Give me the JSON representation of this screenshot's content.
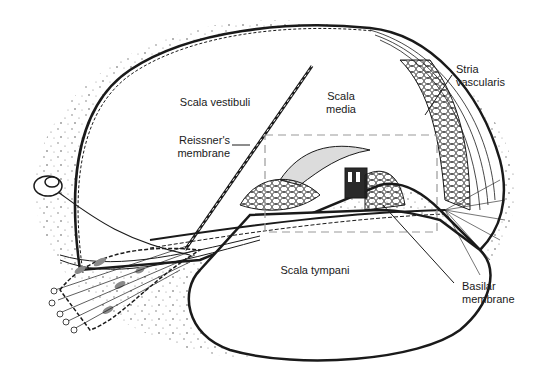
{
  "diagram": {
    "colors": {
      "ink": "#1a1a1a",
      "shade": "#8a8a8a",
      "stipple": "#555555",
      "inset_box": "#9a9a9a",
      "background": "#ffffff"
    },
    "labels": {
      "scala_vestibuli": "Scala vestibuli",
      "scala_media_1": "Scala",
      "scala_media_2": "media",
      "reissners_1": "Reissner's",
      "reissners_2": "membrane",
      "stria_1": "Stria",
      "stria_2": "vascularis",
      "scala_tympani": "Scala tympani",
      "basilar_1": "Basilar",
      "basilar_2": "membrane"
    }
  }
}
